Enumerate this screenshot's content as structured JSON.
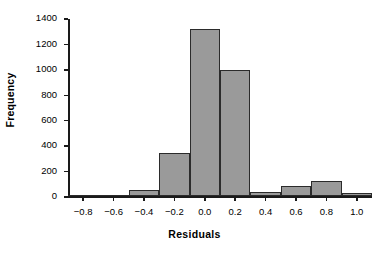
{
  "chart_data": {
    "type": "bar",
    "subtype": "histogram",
    "title": "",
    "xlabel": "Residuals",
    "ylabel": "Frequency",
    "xlim": [
      -0.9,
      1.1
    ],
    "ylim": [
      0,
      1400
    ],
    "grid": false,
    "legend": null,
    "bin_width": 0.2,
    "xtick_labels": [
      "−0.8",
      "−0.6",
      "−0.4",
      "−0.2",
      "0.0",
      "0.2",
      "0.4",
      "0.6",
      "0.8",
      "1.0"
    ],
    "xtick_values": [
      -0.8,
      -0.6,
      -0.4,
      -0.2,
      0.0,
      0.2,
      0.4,
      0.6,
      0.8,
      1.0
    ],
    "ytick_labels": [
      "0",
      "200",
      "400",
      "600",
      "800",
      "1000",
      "1200",
      "1400"
    ],
    "ytick_values": [
      0,
      200,
      400,
      600,
      800,
      1000,
      1200,
      1400
    ],
    "bins": [
      {
        "left": -0.9,
        "right": -0.7,
        "center": -0.8,
        "value": 0
      },
      {
        "left": -0.7,
        "right": -0.5,
        "center": -0.6,
        "value": 0
      },
      {
        "left": -0.5,
        "right": -0.3,
        "center": -0.4,
        "value": 50
      },
      {
        "left": -0.3,
        "right": -0.1,
        "center": -0.2,
        "value": 340
      },
      {
        "left": -0.1,
        "right": 0.1,
        "center": 0.0,
        "value": 1310
      },
      {
        "left": 0.1,
        "right": 0.3,
        "center": 0.2,
        "value": 990
      },
      {
        "left": 0.3,
        "right": 0.5,
        "center": 0.4,
        "value": 35
      },
      {
        "left": 0.5,
        "right": 0.7,
        "center": 0.6,
        "value": 80
      },
      {
        "left": 0.7,
        "right": 0.9,
        "center": 0.8,
        "value": 115
      },
      {
        "left": 0.9,
        "right": 1.1,
        "center": 1.0,
        "value": 20
      }
    ],
    "categories": [
      "-0.8",
      "-0.6",
      "-0.4",
      "-0.2",
      "0.0",
      "0.2",
      "0.4",
      "0.6",
      "0.8",
      "1.0"
    ],
    "values": [
      0,
      0,
      50,
      340,
      1310,
      990,
      35,
      80,
      115,
      20
    ],
    "colors": {
      "bar_fill": "#9a9a9a",
      "bar_edge": "#2b2b2b",
      "axis": "#1a1a1a",
      "text": "#000000",
      "background": "#ffffff"
    }
  }
}
